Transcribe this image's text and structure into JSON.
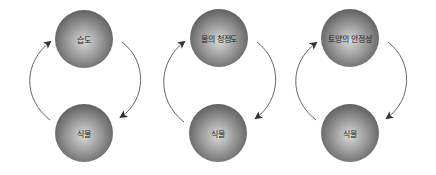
{
  "diagram": {
    "type": "cycle-diagrams",
    "colors": {
      "sphere_dark": "#3c3c3c",
      "sphere_light": "#d9d9d9",
      "arrow": "#555555",
      "background": "#ffffff"
    },
    "cycles": [
      {
        "top": {
          "label": "습도"
        },
        "bottom": {
          "label": "식물"
        }
      },
      {
        "top": {
          "label": "물의 청정도"
        },
        "bottom": {
          "label": "식물"
        }
      },
      {
        "top": {
          "label": "토양의 안정성"
        },
        "bottom": {
          "label": "식물"
        }
      }
    ]
  }
}
